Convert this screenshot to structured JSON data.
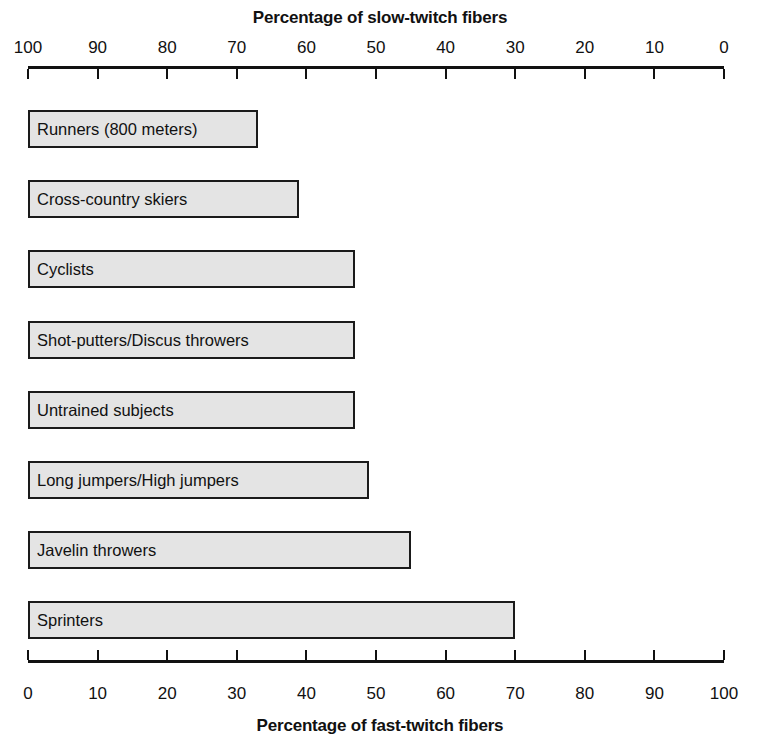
{
  "chart_data": {
    "type": "bar",
    "title": "",
    "orientation": "horizontal",
    "top_axis_label": "Percentage of slow-twitch fibers",
    "bottom_axis_label": "Percentage of fast-twitch fibers",
    "ylabel": "",
    "grid": false,
    "legend": "none",
    "top_axis": {
      "label": "Percentage of slow-twitch fibers",
      "ticks": [
        100,
        90,
        80,
        70,
        60,
        50,
        40,
        30,
        20,
        10,
        0
      ],
      "direction": "right-to-left",
      "range": [
        100,
        0
      ]
    },
    "bottom_axis": {
      "label": "Percentage of fast-twitch fibers",
      "ticks": [
        0,
        10,
        20,
        30,
        40,
        50,
        60,
        70,
        80,
        90,
        100
      ],
      "direction": "left-to-right",
      "range": [
        0,
        100
      ]
    },
    "xlim": [
      0,
      100
    ],
    "categories": [
      "Runners (800 meters)",
      "Cross-country skiers",
      "Cyclists",
      "Shot-putters/Discus throwers",
      "Untrained subjects",
      "Long jumpers/High jumpers",
      "Javelin throwers",
      "Sprinters"
    ],
    "values": [
      33,
      39,
      47,
      47,
      47,
      49,
      55,
      70
    ],
    "series": [
      {
        "name": "Percentage of fast-twitch fibers",
        "values": [
          33,
          39,
          47,
          47,
          47,
          49,
          55,
          70
        ]
      }
    ],
    "bars": [
      {
        "label": "Runners (800 meters)",
        "fast_twitch": 33,
        "slow_twitch": 67
      },
      {
        "label": "Cross-country skiers",
        "fast_twitch": 39,
        "slow_twitch": 61
      },
      {
        "label": "Cyclists",
        "fast_twitch": 47,
        "slow_twitch": 53
      },
      {
        "label": "Shot-putters/Discus throwers",
        "fast_twitch": 47,
        "slow_twitch": 53
      },
      {
        "label": "Untrained subjects",
        "fast_twitch": 47,
        "slow_twitch": 53
      },
      {
        "label": "Long jumpers/High jumpers",
        "fast_twitch": 49,
        "slow_twitch": 51
      },
      {
        "label": "Javelin throwers",
        "fast_twitch": 55,
        "slow_twitch": 45
      },
      {
        "label": "Sprinters",
        "fast_twitch": 70,
        "slow_twitch": 30
      }
    ],
    "colors": {
      "bar_fill": "#e4e4e4",
      "bar_stroke": "#1a1a1a",
      "axis": "#111111",
      "text": "#111111",
      "background": "#ffffff"
    }
  }
}
